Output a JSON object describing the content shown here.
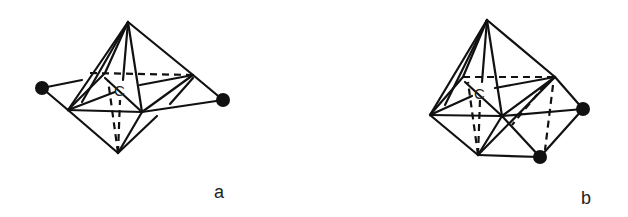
{
  "figures": [
    {
      "id": "a",
      "label": "a",
      "center_label": "C",
      "description": "Octahedral cluster around central carbon with two capping atoms on opposite faces (trans)"
    },
    {
      "id": "b",
      "label": "b",
      "center_label": "C",
      "description": "Octahedral cluster around central carbon with two capping atoms on adjacent faces (cis)"
    }
  ],
  "colors": {
    "line": "#111111",
    "atom": "#111111",
    "background": "#ffffff"
  }
}
